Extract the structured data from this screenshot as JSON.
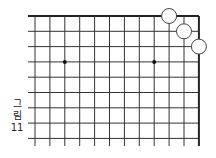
{
  "figure": {
    "caption_lines": [
      "그",
      "림",
      "11"
    ],
    "caption": "그림 11"
  },
  "board": {
    "view": "top-right corner",
    "columns_visible": 12,
    "rows_visible": 9,
    "origin_x": 35,
    "origin_y": 16,
    "spacing_x": 14.9,
    "spacing_y": 15.3,
    "line_left_x": 28,
    "line_bottom_y": 146,
    "edge_top": true,
    "edge_right": true,
    "line_color": "#333333",
    "edge_color": "#222222",
    "star_points": [
      {
        "col": 2,
        "row": 3
      },
      {
        "col": 8,
        "row": 3
      }
    ],
    "stones": [
      {
        "color": "white",
        "col": 9,
        "row": 0
      },
      {
        "color": "white",
        "col": 10,
        "row": 1
      },
      {
        "color": "white",
        "col": 11,
        "row": 2
      }
    ],
    "stone_radius": 7.5,
    "stone_fill": "#ffffff",
    "stone_stroke": "#444444"
  }
}
